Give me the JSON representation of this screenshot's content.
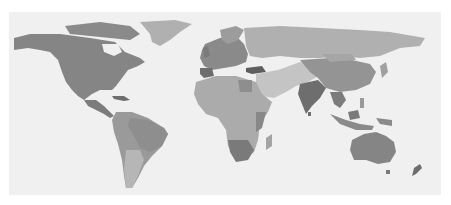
{
  "map": {
    "type": "world choropleth (grayscale)",
    "colors": {
      "background": "#ffffff",
      "ocean": "#f0f0f0",
      "darkest": "#6e6e6e",
      "dark": "#858585",
      "medium": "#9a9a9a",
      "light": "#b0b0b0",
      "lighter": "#c4c4c4"
    },
    "regions": [
      {
        "name": "North America",
        "shade": "dark"
      },
      {
        "name": "Greenland",
        "shade": "light"
      },
      {
        "name": "Central America",
        "shade": "dark"
      },
      {
        "name": "South America",
        "shade": "medium"
      },
      {
        "name": "Europe",
        "shade": "medium"
      },
      {
        "name": "Russia",
        "shade": "light"
      },
      {
        "name": "Africa",
        "shade": "light"
      },
      {
        "name": "Southern Africa",
        "shade": "dark"
      },
      {
        "name": "Middle East",
        "shade": "lighter"
      },
      {
        "name": "India",
        "shade": "darkest"
      },
      {
        "name": "China",
        "shade": "medium"
      },
      {
        "name": "Southeast Asia",
        "shade": "dark"
      },
      {
        "name": "Australia",
        "shade": "dark"
      },
      {
        "name": "New Zealand",
        "shade": "darkest"
      }
    ]
  }
}
